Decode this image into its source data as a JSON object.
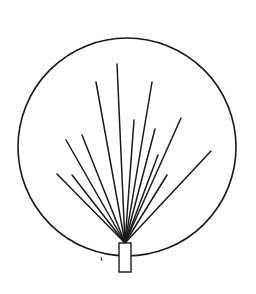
{
  "diagram": {
    "type": "fan-in-circle",
    "stroke_color": "#1a1a1a",
    "background": "#ffffff",
    "circle": {
      "cx": 127,
      "cy": 147,
      "r": 109
    },
    "base": {
      "x": 119,
      "y": 243,
      "width": 12,
      "height": 29
    },
    "origin": {
      "x": 125,
      "y": 243
    },
    "tick": {
      "x1": 101,
      "y1": 257,
      "x2": 102,
      "y2": 261
    },
    "rays": [
      {
        "x": 57,
        "y": 174
      },
      {
        "x": 72,
        "y": 175
      },
      {
        "x": 66,
        "y": 140
      },
      {
        "x": 82,
        "y": 135
      },
      {
        "x": 96,
        "y": 82
      },
      {
        "x": 117,
        "y": 64
      },
      {
        "x": 134,
        "y": 120
      },
      {
        "x": 152,
        "y": 82
      },
      {
        "x": 155,
        "y": 129
      },
      {
        "x": 158,
        "y": 155
      },
      {
        "x": 167,
        "y": 175
      },
      {
        "x": 181,
        "y": 118
      },
      {
        "x": 211,
        "y": 151
      }
    ]
  }
}
